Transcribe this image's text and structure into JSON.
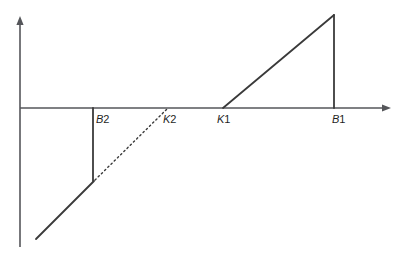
{
  "diagram": {
    "type": "piecewise-linear-function-graph",
    "background": "#ffffff",
    "axis_color": "#55565a",
    "line_color": "#3a3a3a",
    "label_color": "#1f1f1f",
    "width": 402,
    "height": 256,
    "axes": {
      "x_axis": {
        "y": 108,
        "x_start": 20,
        "x_end": 391,
        "arrow": "right"
      },
      "y_axis": {
        "x": 20,
        "y_bottom": 247,
        "y_top": 16,
        "arrow": "up"
      }
    },
    "labels": [
      {
        "id": "B2",
        "letter": "B",
        "digit": "2",
        "x": 96,
        "y": 123
      },
      {
        "id": "K2",
        "letter": "K",
        "digit": "2",
        "x": 163,
        "y": 123
      },
      {
        "id": "K1",
        "letter": "K",
        "digit": "1",
        "x": 217,
        "y": 123
      },
      {
        "id": "B1",
        "letter": "B",
        "digit": "1",
        "x": 332,
        "y": 123
      }
    ],
    "segments": [
      {
        "name": "lower-branch-diagonal-solid",
        "x1": 36,
        "y1": 239,
        "x2": 94,
        "y2": 181,
        "style": "solid"
      },
      {
        "name": "vertical-drop-at-B2",
        "x1": 93,
        "y1": 108,
        "x2": 93,
        "y2": 181,
        "style": "solid"
      },
      {
        "name": "dotted-diagonal-B2-to-K2",
        "x1": 95,
        "y1": 180,
        "x2": 168,
        "y2": 108,
        "style": "dotted"
      },
      {
        "name": "upper-branch-diagonal-solid",
        "x1": 223,
        "y1": 108,
        "x2": 334,
        "y2": 15,
        "style": "solid"
      },
      {
        "name": "vertical-drop-at-B1",
        "x1": 334,
        "y1": 15,
        "x2": 334,
        "y2": 108,
        "style": "solid"
      }
    ]
  }
}
